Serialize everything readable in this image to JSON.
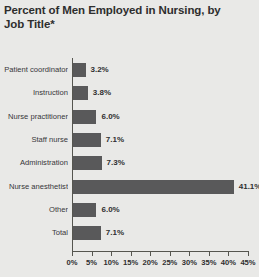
{
  "chart_data": {
    "type": "bar",
    "orientation": "horizontal",
    "title": "Percent of Men Employed in Nursing, by Job Title*",
    "title_lines": [
      "Percent of Men Employed in Nursing, by",
      "Job Title*"
    ],
    "xlabel": "",
    "ylabel": "",
    "categories": [
      "Patient coordinator",
      "Instruction",
      "Nurse practitioner",
      "Staff nurse",
      "Administration",
      "Nurse anesthetist",
      "Other",
      "Total"
    ],
    "values": [
      3.2,
      3.8,
      6.0,
      7.1,
      7.3,
      41.1,
      6.0,
      7.1
    ],
    "value_labels": [
      "3.2%",
      "3.8%",
      "6.0%",
      "7.1%",
      "7.3%",
      "41.1%",
      "6.0%",
      "7.1%"
    ],
    "xlim": [
      0,
      45
    ],
    "xticks": [
      0,
      5,
      10,
      15,
      20,
      25,
      30,
      35,
      40,
      45
    ],
    "xtick_labels": [
      "0%",
      "5%",
      "10%",
      "15%",
      "20%",
      "25%",
      "30%",
      "35%",
      "40%",
      "45%"
    ],
    "grid": false,
    "legend": null,
    "bar_color": "#59595a",
    "background_color": "#e9e9e7",
    "axis_color": "#55554f"
  }
}
